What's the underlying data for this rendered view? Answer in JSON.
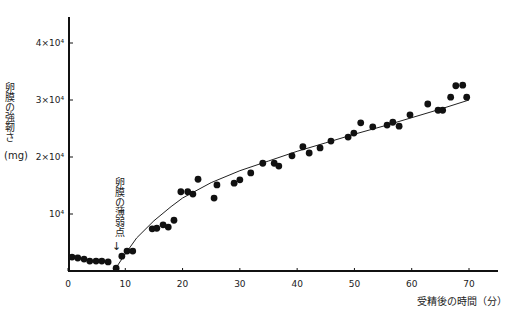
{
  "chart_data": {
    "type": "scatter",
    "title": "",
    "xlabel": "受精後の時間（分）",
    "ylabel": "卵膜の強靭さ",
    "yunit": "mg",
    "xlim": [
      0,
      75
    ],
    "ylim": [
      0,
      45000
    ],
    "xticks": [
      0,
      10,
      20,
      30,
      40,
      50,
      60,
      70
    ],
    "xtick_labels": [
      "0",
      "10",
      "20",
      "30",
      "40",
      "50",
      "60",
      "70"
    ],
    "yticks": [
      10000,
      20000,
      30000,
      40000
    ],
    "ytick_labels": [
      "10⁴",
      "2×10⁴",
      "3×10⁴",
      "4×10⁴"
    ],
    "grid": false,
    "legend": null,
    "annotations": [
      {
        "text": "卵膜の薄弱点",
        "x": 8,
        "arrow": "↓"
      }
    ],
    "series": [
      {
        "name": "measured",
        "marker": "filled-circle",
        "points": [
          [
            0.7,
            2450
          ],
          [
            1.7,
            2280
          ],
          [
            2.8,
            2100
          ],
          [
            3.8,
            1750
          ],
          [
            4.9,
            1750
          ],
          [
            5.9,
            1750
          ],
          [
            7.0,
            1600
          ],
          [
            8.4,
            500
          ],
          [
            9.4,
            2600
          ],
          [
            10.3,
            3500
          ],
          [
            11.3,
            3500
          ],
          [
            14.7,
            7400
          ],
          [
            15.5,
            7500
          ],
          [
            16.6,
            8100
          ],
          [
            17.5,
            7700
          ],
          [
            18.5,
            8900
          ],
          [
            19.7,
            13900
          ],
          [
            20.9,
            13900
          ],
          [
            21.8,
            13500
          ],
          [
            22.7,
            16100
          ],
          [
            25.5,
            12800
          ],
          [
            26.0,
            15100
          ],
          [
            29.0,
            15400
          ],
          [
            30.0,
            16000
          ],
          [
            31.9,
            17200
          ],
          [
            34.0,
            18900
          ],
          [
            36.0,
            18900
          ],
          [
            36.8,
            18400
          ],
          [
            39.1,
            20200
          ],
          [
            41.0,
            21800
          ],
          [
            42.1,
            20700
          ],
          [
            44.0,
            21600
          ],
          [
            45.9,
            22800
          ],
          [
            48.9,
            23500
          ],
          [
            49.9,
            24200
          ],
          [
            51.1,
            26000
          ],
          [
            53.2,
            25300
          ],
          [
            55.7,
            25600
          ],
          [
            56.7,
            26100
          ],
          [
            57.8,
            25400
          ],
          [
            59.7,
            27400
          ],
          [
            62.8,
            29300
          ],
          [
            64.6,
            28200
          ],
          [
            65.4,
            28200
          ],
          [
            66.8,
            30500
          ],
          [
            67.7,
            32500
          ],
          [
            68.9,
            32600
          ],
          [
            69.6,
            30500
          ]
        ]
      },
      {
        "name": "fit-curve",
        "type": "line",
        "points": [
          [
            8.2,
            300
          ],
          [
            10,
            3000
          ],
          [
            12,
            5800
          ],
          [
            15,
            8800
          ],
          [
            18,
            11300
          ],
          [
            20,
            12800
          ],
          [
            25,
            15500
          ],
          [
            30,
            17600
          ],
          [
            35,
            19300
          ],
          [
            40,
            21000
          ],
          [
            45,
            22500
          ],
          [
            50,
            24000
          ],
          [
            55,
            25400
          ],
          [
            60,
            26900
          ],
          [
            65,
            28400
          ],
          [
            70,
            30000
          ]
        ]
      }
    ]
  }
}
